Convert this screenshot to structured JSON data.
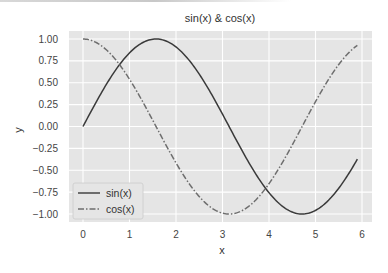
{
  "chart_data": {
    "type": "line",
    "title": "sin(x) & cos(x)",
    "xlabel": "x",
    "ylabel": "y",
    "xlim": [
      -0.3,
      6.2
    ],
    "ylim": [
      -1.1,
      1.1
    ],
    "xticks": [
      "0",
      "1",
      "2",
      "3",
      "4",
      "5",
      "6"
    ],
    "yticks": [
      "1.00",
      "0.75",
      "0.50",
      "0.25",
      "0.00",
      "−0.25",
      "−0.50",
      "−0.75",
      "−1.00"
    ],
    "grid": true,
    "legend_position": "lower left",
    "x_range": [
      0,
      5.9
    ],
    "series": [
      {
        "name": "sin(x)",
        "function": "sin",
        "style": "solid",
        "color": "#3a3a3a"
      },
      {
        "name": "cos(x)",
        "function": "cos",
        "style": "dashdot",
        "color": "#6e6e6e"
      }
    ],
    "sample_points": {
      "x": [
        0,
        0.5,
        1,
        1.5,
        2,
        2.5,
        3,
        3.5,
        4,
        4.5,
        5,
        5.5,
        5.9
      ],
      "sin": [
        0.0,
        0.48,
        0.84,
        1.0,
        0.91,
        0.6,
        0.14,
        -0.35,
        -0.76,
        -0.98,
        -0.96,
        -0.71,
        -0.37
      ],
      "cos": [
        1.0,
        0.88,
        0.54,
        0.07,
        -0.42,
        -0.8,
        -0.99,
        -0.94,
        -0.65,
        -0.21,
        0.28,
        0.71,
        0.93
      ]
    }
  },
  "colors": {
    "plot_bg": "#e5e5e5",
    "grid": "#ffffff",
    "sin_line": "#3a3a3a",
    "cos_line": "#6e6e6e"
  }
}
